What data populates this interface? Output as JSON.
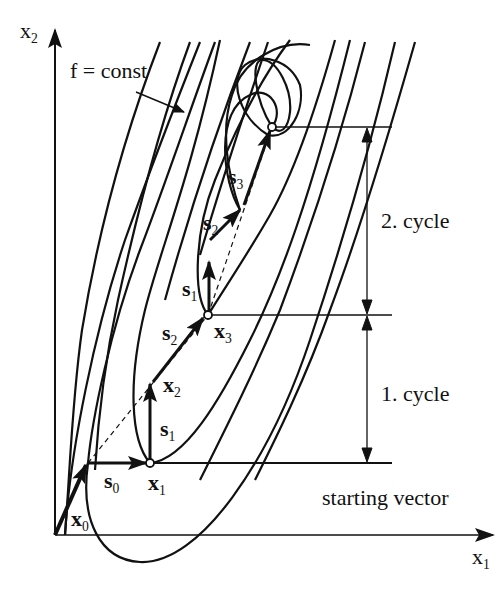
{
  "diagram": {
    "axes": {
      "x_label": "x",
      "x_sub": "1",
      "y_label": "x",
      "y_sub": "2"
    },
    "annotations": {
      "contour_label": "f = const",
      "cycle_1": "1. cycle",
      "cycle_2": "2. cycle",
      "starting_vector": "starting vector"
    },
    "vectors": {
      "x0": {
        "base": "x",
        "sub": "0"
      },
      "x1": {
        "base": "x",
        "sub": "1"
      },
      "x2": {
        "base": "x",
        "sub": "2"
      },
      "x3": {
        "base": "x",
        "sub": "3"
      },
      "s0": {
        "base": "s",
        "sub": "0"
      },
      "s1_a": {
        "base": "s",
        "sub": "1"
      },
      "s2_a": {
        "base": "s",
        "sub": "2"
      },
      "s1_b": {
        "base": "s",
        "sub": "1"
      },
      "s2_b": {
        "base": "s",
        "sub": "2"
      },
      "s3": {
        "base": "s",
        "sub": "3"
      }
    },
    "colors": {
      "ink": "#111111",
      "background": "#ffffff"
    }
  }
}
